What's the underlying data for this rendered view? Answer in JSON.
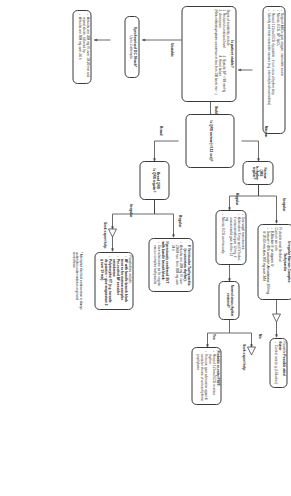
{
  "document": {
    "type": "clinical-algorithm-flowchart",
    "title": "Tachycardia (with pulse) algorithm",
    "orientation": "rotated-90-degrees",
    "accent_color": "#3a3a3a",
    "background_color": "#ffffff"
  },
  "boxes": {
    "initial_assessment": {
      "items": [
        "Support ABCs: give oxygen; cannulate a vein",
        "Monitor ECG, BP, SpO₂",
        "Record 12-lead ECG if possible ; if not, record rhythm strip",
        "Identify and treat reversible causes (e.g. electrolyte abnormalities)"
      ]
    },
    "patient_stable": {
      "title": "Is patient stable?",
      "intro": "Signs of instability include",
      "list_left": [
        "1. Reduced conscious level",
        "2. chest pain"
      ],
      "list_right": [
        "3. Systolic BP < 90 mmHg",
        "4. Heart failure"
      ],
      "footnote": "(Rate-related symptoms uncommon at less than 150 beats min⁻¹)"
    },
    "synchronised_shock": {
      "title": "Synchronised DC Shock*",
      "subtitle": "Up to 3 attempts",
      "items": [
        "Amiodarone 300 mg IV over 10-20 min and repeat shock; followed by:",
        "Amiodarone 900 mg over 24 h"
      ]
    },
    "qrs_narrow": {
      "title": "Is QRS narrow (<0.12 sec)?"
    },
    "broad_qrs": {
      "title_line1": "Broad QRS",
      "title_line2": "Is QRS regular?"
    },
    "narrow_qrs": {
      "title_line1": "Narrow QRS",
      "title_line2": "Is rhythm regular?"
    },
    "ventricular_tachycardia": {
      "title_line1": "If Ventricular Tachycardia",
      "title_line2": "(or uncertain rhythm):",
      "items": [
        "Amiodarone 300 mg IV over 20-60 min; then 900 mg over 24 h"
      ],
      "secondary_title_line1": "If previously confirmed SVT",
      "secondary_title_line2": "with bundle branch block:",
      "secondary_items": [
        "Give adenosine as for regular narrow complex tachycardia"
      ]
    },
    "broad_irregular_expert": {
      "intro": "Possibilities include:",
      "items": [
        "AF with bundle branch block treat as for narrow complex",
        "Pre-excited AF consider amiodarone",
        "Polymorphic VT (e.g. torsade de pointes – give magnesium 2 g over 10 min)"
      ],
      "footnote": "* Attempted electrical cardioversion is always undertaken under sedation or general anaesthesia"
    },
    "vagal_manoeuvres": {
      "items": [
        "Use vagal manoeuvres",
        "Adenosine 6 mg rapid IV bolus; if unsuccessful give 12 mg; if unsuccessful give further 12 mg",
        "Monitor ECG continuously"
      ]
    },
    "sinus_restored": {
      "title": "Normal sinus rhythm restored?"
    },
    "psvt": {
      "title": "Probable re-entry PSVT:",
      "items": [
        "Record 12-lead ECG in sinus rhythm",
        "If recurs, give adenosine again & consider choice of anti-arrhythmic prophylaxis"
      ]
    },
    "irregular_narrow": {
      "title_line1": "Irregular Narrow Complex",
      "title_line2": "Tachycardia",
      "subtitle_line1": "Probable atrial fibrillation",
      "subtitle_line2": "Control rate with:",
      "items": [
        "β-Blocker IV or digoxin IV",
        "If onset < 48 h consider: Amiodarone 300 mg IV 20-60 min then 900 mg over 24 h"
      ]
    },
    "atrial_flutter": {
      "title": "Possible atrial flutter",
      "items": [
        "Control rate (e.g. β-Blocker)"
      ]
    }
  },
  "edge_labels": {
    "unstable": "Unstable",
    "stable": "Stable",
    "broad": "Broad",
    "narrow": "Narrow",
    "regular_broad": "Regular",
    "irregular_broad": "Irregular",
    "regular_narrow": "Regular",
    "irregular_narrow": "Irregular",
    "yes": "Yes",
    "no": "No"
  },
  "expert_help": {
    "label_broad": "Seek expert help",
    "label_narrow": "Seek expert help"
  }
}
